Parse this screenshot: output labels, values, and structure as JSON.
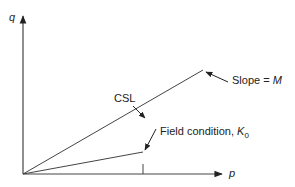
{
  "diagram": {
    "axes": {
      "y_label": "q",
      "x_label": "p"
    },
    "lines": {
      "csl_label": "CSL",
      "slope_label_prefix": "Slope = ",
      "slope_label_var": "M",
      "field_label_prefix": "Field condition, ",
      "field_label_var": "K",
      "field_label_sub": "0"
    },
    "colors": {
      "line": "#333333",
      "text": "#222222",
      "background": "#ffffff"
    }
  }
}
